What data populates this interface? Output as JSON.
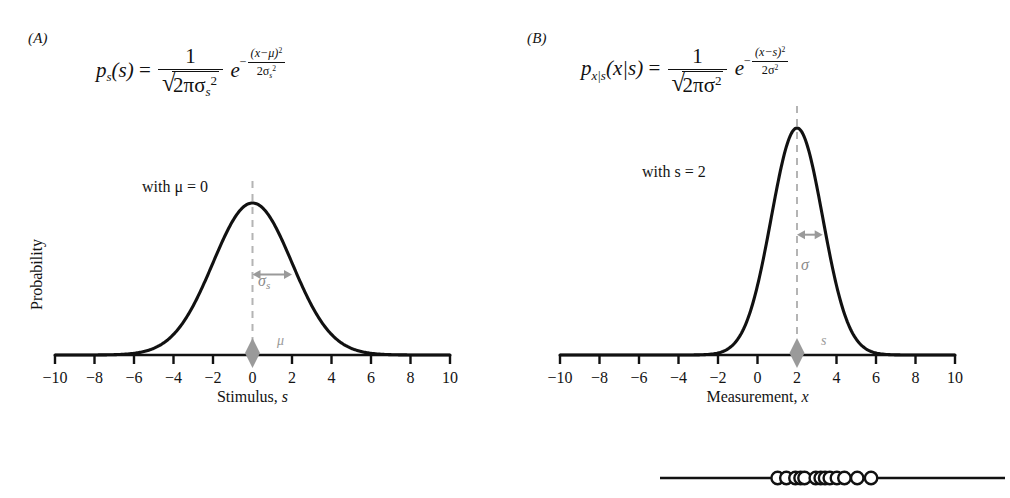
{
  "figure": {
    "background": "#ffffff",
    "curve_color": "#111111",
    "accent_gray": "#9a9a9a",
    "dashed_color": "#b0b0b0"
  },
  "panels": [
    {
      "letter": "(A)",
      "formula": {
        "lhs_p": "p",
        "lhs_sub": "s",
        "lhs_arg": "(s)",
        "equals": "=",
        "frac_num": "1",
        "frac_den_inner": "2πσ",
        "frac_den_sub": "s",
        "frac_den_sup": "2",
        "e": "e",
        "exp_minus": "−",
        "exp_num": "(x−μ)",
        "exp_num_sup": "2",
        "exp_den": "2σ",
        "exp_den_sub": "s",
        "exp_den_sup": "2"
      },
      "with_label": "with μ = 0",
      "ylabel": "Probability",
      "axis_label_text": "Stimulus, ",
      "axis_label_var": "s",
      "sigma_label": "σ",
      "sigma_sub": "s",
      "marker_label": "μ",
      "ticks": [
        "−10",
        "−8",
        "−6",
        "−4",
        "−2",
        "0",
        "2",
        "4",
        "6",
        "8",
        "10"
      ],
      "samples_line": false
    },
    {
      "letter": "(B)",
      "formula": {
        "lhs_p": "p",
        "lhs_sub": "x|s",
        "lhs_arg": "(x|s)",
        "equals": "=",
        "frac_num": "1",
        "frac_den_inner": "2πσ",
        "frac_den_sub": "",
        "frac_den_sup": "2",
        "e": "e",
        "exp_minus": "−",
        "exp_num": "(x−s)",
        "exp_num_sup": "2",
        "exp_den": "2σ",
        "exp_den_sub": "",
        "exp_den_sup": "2"
      },
      "with_label": "with s = 2",
      "ylabel": "",
      "axis_label_text": "Measurement, ",
      "axis_label_var": "x",
      "sigma_label": "σ",
      "sigma_sub": "",
      "marker_label": "s",
      "ticks": [
        "−10",
        "−8",
        "−6",
        "−4",
        "−2",
        "0",
        "2",
        "4",
        "6",
        "8",
        "10"
      ],
      "samples_line": true
    }
  ],
  "chart_data": {
    "type": "line",
    "title": "",
    "panels": [
      {
        "name": "A",
        "curve": "gaussian",
        "mean": 0,
        "sigma": 2.0,
        "peak_height_px": 152,
        "xlabel": "Stimulus, s",
        "ylabel": "Probability",
        "xlim": [
          -10,
          10
        ],
        "xticks": [
          -10,
          -8,
          -6,
          -4,
          -2,
          0,
          2,
          4,
          6,
          8,
          10
        ],
        "grid": false,
        "marker": {
          "value": 0,
          "label": "μ",
          "shape": "diamond"
        },
        "sigma_arrow": {
          "from": 0,
          "to": 2.0,
          "label": "σs"
        }
      },
      {
        "name": "B",
        "curve": "gaussian",
        "mean": 2,
        "sigma": 1.3,
        "peak_height_px": 227,
        "xlabel": "Measurement, x",
        "ylabel": "",
        "xlim": [
          -10,
          10
        ],
        "xticks": [
          -10,
          -8,
          -6,
          -4,
          -2,
          0,
          2,
          4,
          6,
          8,
          10
        ],
        "grid": false,
        "marker": {
          "value": 2,
          "label": "s",
          "shape": "diamond"
        },
        "sigma_arrow": {
          "from": 2,
          "to": 3.3,
          "label": "σ"
        },
        "samples": [
          1.02,
          1.46,
          1.92,
          2.18,
          2.38,
          2.95,
          3.2,
          3.42,
          3.66,
          4.02,
          4.4,
          5.05,
          5.75
        ]
      }
    ]
  }
}
